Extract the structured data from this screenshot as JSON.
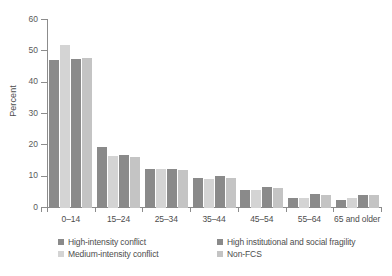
{
  "chart_data": {
    "type": "bar",
    "title": "",
    "subtitle": "",
    "xlabel": "",
    "ylabel": "Percent",
    "ylim": [
      0,
      60
    ],
    "yticks": [
      0,
      10,
      20,
      30,
      40,
      50,
      60
    ],
    "grid": false,
    "legend_position": "bottom",
    "categories": [
      "0–14",
      "15–24",
      "25–34",
      "35–44",
      "45–54",
      "55–64",
      "65 and older"
    ],
    "series": [
      {
        "name": "High-intensity conflict",
        "color": "#8a8a8a",
        "values": [
          47.2,
          19.6,
          12.4,
          9.5,
          5.8,
          3.2,
          2.6
        ]
      },
      {
        "name": "Medium-intensity conflict",
        "color": "#d4d4d4",
        "values": [
          52.0,
          16.6,
          12.6,
          9.2,
          5.8,
          3.3,
          3.2
        ]
      },
      {
        "name": "High institutional and social fragility",
        "color": "#8a8a8a",
        "values": [
          47.5,
          16.8,
          12.5,
          10.2,
          6.6,
          4.4,
          4.3
        ]
      },
      {
        "name": "Non-FCS",
        "color": "#c4c4c4",
        "values": [
          47.8,
          16.3,
          12.1,
          9.6,
          6.5,
          4.2,
          4.2
        ]
      }
    ]
  },
  "axes": {
    "y_title": "Percent",
    "y_tick_labels": [
      "60",
      "50",
      "40",
      "30",
      "20",
      "10",
      "0"
    ],
    "x_tick_labels": [
      "0–14",
      "15–24",
      "25–34",
      "35–44",
      "45–54",
      "55–64",
      "65 and older"
    ]
  },
  "legend": {
    "items": [
      {
        "label": "High-intensity conflict",
        "color": "#8a8a8a"
      },
      {
        "label": "High institutional and social fragility",
        "color": "#8a8a8a"
      },
      {
        "label": "Medium-intensity conflict",
        "color": "#d4d4d4"
      },
      {
        "label": "Non-FCS",
        "color": "#c4c4c4"
      }
    ]
  },
  "footnote": {
    "text": ""
  },
  "colors": {
    "axis": "#8c8c8c",
    "text": "#4d4d4d",
    "background": "#ffffff"
  }
}
